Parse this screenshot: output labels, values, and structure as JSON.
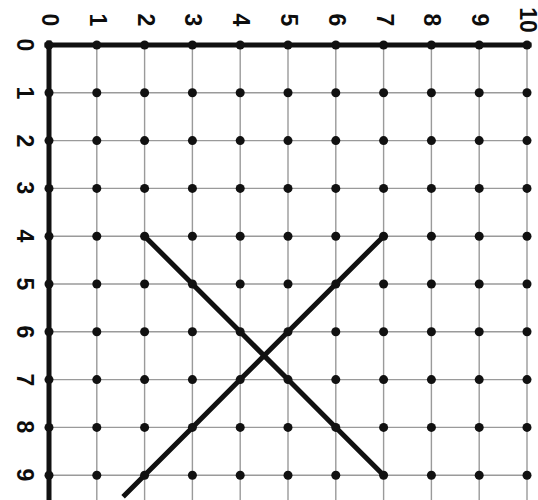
{
  "figure": {
    "background_color": "#ffffff",
    "width": 538,
    "height": 500
  },
  "chart_data": {
    "type": "scatter",
    "title": "",
    "xlabel": "",
    "ylabel": "",
    "xlim": [
      0,
      10
    ],
    "ylim": [
      0,
      9
    ],
    "grid": true,
    "legend": false,
    "x_tick_labels": [
      "0",
      "1",
      "2",
      "3",
      "4",
      "5",
      "6",
      "7",
      "8",
      "9",
      "10"
    ],
    "y_tick_labels": [
      "0",
      "1",
      "2",
      "3",
      "4",
      "5",
      "6",
      "7",
      "8",
      "9"
    ],
    "x_ticks": [
      0,
      1,
      2,
      3,
      4,
      5,
      6,
      7,
      8,
      9,
      10
    ],
    "y_ticks": [
      0,
      1,
      2,
      3,
      4,
      5,
      6,
      7,
      8,
      9
    ],
    "y_axis_direction": "downward",
    "lattice_points": {
      "description": "Black dot at every integer intersection",
      "x_range": [
        0,
        10
      ],
      "y_range": [
        0,
        9
      ],
      "marker": "filled-circle",
      "marker_color": "#111111",
      "marker_size_px": 9
    },
    "series": [
      {
        "name": "descending-diagonal",
        "type": "line",
        "color": "#111111",
        "width_px": 5,
        "points": [
          [
            2,
            4
          ],
          [
            3,
            5
          ],
          [
            4,
            6
          ],
          [
            5,
            7
          ],
          [
            6,
            8
          ],
          [
            7,
            9
          ]
        ]
      },
      {
        "name": "ascending-diagonal",
        "type": "line",
        "color": "#111111",
        "width_px": 5,
        "points": [
          [
            7,
            4
          ],
          [
            6,
            5
          ],
          [
            5,
            6
          ],
          [
            4,
            7
          ],
          [
            3,
            8
          ],
          [
            2,
            9
          ],
          [
            1.55,
            9.45
          ]
        ],
        "note": "continues past the bottom edge of the frame"
      }
    ],
    "annotations": [
      {
        "text": "lines cross near (4.5, 6.5)",
        "x": 4.5,
        "y": 6.5
      }
    ]
  },
  "axes": {
    "x_axis": {
      "label_position": "top",
      "labels": [
        "0",
        "1",
        "2",
        "3",
        "4",
        "5",
        "6",
        "7",
        "8",
        "9",
        "10"
      ],
      "line_color": "#111111",
      "line_width_px": 5
    },
    "y_axis": {
      "label_position": "left",
      "labels": [
        "0",
        "1",
        "2",
        "3",
        "4",
        "5",
        "6",
        "7",
        "8",
        "9"
      ],
      "line_color": "#111111",
      "line_width_px": 5
    },
    "grid_line_color": "#9a9a9a",
    "grid_line_width_px": 1.4
  },
  "geometry": {
    "origin_x_px": 49,
    "origin_y_px": 45,
    "cell_px": 47.8
  }
}
